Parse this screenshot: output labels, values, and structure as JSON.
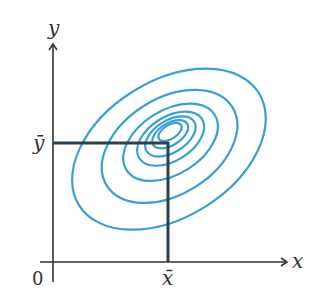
{
  "diagram": {
    "type": "contour-plot",
    "axes": {
      "x_label": "x",
      "y_label": "y",
      "origin_label": "0"
    },
    "markers": {
      "x_mean_label": "x̄",
      "y_mean_label": "ȳ"
    },
    "contours": {
      "count": 7,
      "shape": "concentric tilted ellipses",
      "color": "#3a9fd4"
    },
    "colors": {
      "axis": "#333333",
      "mean_lines": "#2b3f4f",
      "contour": "#3a9fd4"
    }
  }
}
